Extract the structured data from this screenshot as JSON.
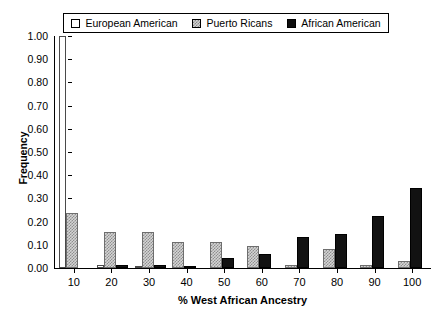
{
  "legend": {
    "entries": [
      {
        "label": "European American",
        "swatch": "white-square-icon",
        "fill": "#ffffff"
      },
      {
        "label": "Puerto Ricans",
        "swatch": "hatched-square-icon",
        "fill": "#d4d4d4"
      },
      {
        "label": "African American",
        "swatch": "black-square-icon",
        "fill": "#121212"
      }
    ]
  },
  "chart_data": {
    "type": "bar",
    "title": "",
    "xlabel": "% West African Ancestry",
    "ylabel": "Frequency",
    "categories": [
      "10",
      "20",
      "30",
      "40",
      "50",
      "60",
      "70",
      "80",
      "90",
      "100"
    ],
    "series": [
      {
        "name": "European American",
        "values": [
          1.0,
          0.015,
          0.005,
          0.0,
          0.0,
          0.0,
          0.0,
          0.0,
          0.0,
          0.0
        ]
      },
      {
        "name": "Puerto Ricans",
        "values": [
          0.235,
          0.155,
          0.155,
          0.11,
          0.11,
          0.095,
          0.015,
          0.08,
          0.015,
          0.03
        ]
      },
      {
        "name": "African American",
        "values": [
          0.0,
          0.015,
          0.015,
          0.01,
          0.045,
          0.06,
          0.135,
          0.145,
          0.225,
          0.345
        ]
      }
    ],
    "ylim": [
      0,
      1.0
    ],
    "ytick_values": [
      0.0,
      0.1,
      0.2,
      0.3,
      0.4,
      0.5,
      0.6,
      0.7,
      0.8,
      0.9,
      1.0
    ],
    "ytick_labels": [
      "0.00",
      "0.10",
      "0.20",
      "0.30",
      "0.40",
      "0.50",
      "0.60",
      "0.70",
      "0.80",
      "0.90",
      "1.00"
    ],
    "grid": false,
    "legend_position": "top"
  }
}
